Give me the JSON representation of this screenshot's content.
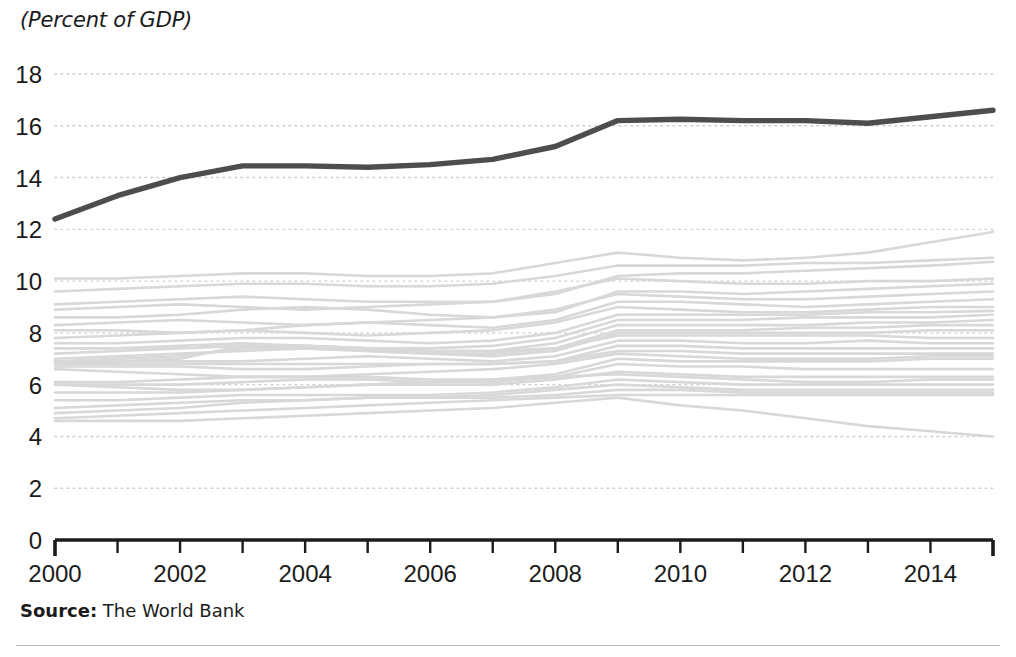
{
  "figure": {
    "unit_label": "(Percent of GDP)",
    "source_label": "Source:",
    "source_value": " The World Bank",
    "highlight_color": "#4d4d4d",
    "background_series_color": "#d8d8d8",
    "gridline_color": "#cccccc",
    "axis_color": "#1b1b1b",
    "background_color": "#ffffff"
  },
  "chart_data": {
    "type": "line",
    "title": "",
    "subtitle": "",
    "xlabel": "",
    "ylabel": "(Percent of GDP)",
    "xlim": [
      2000,
      2015
    ],
    "ylim": [
      0,
      18
    ],
    "grid": true,
    "legend": "none",
    "x": [
      2000,
      2001,
      2002,
      2003,
      2004,
      2005,
      2006,
      2007,
      2008,
      2009,
      2010,
      2011,
      2012,
      2013,
      2014,
      2015
    ],
    "x_tick_labels": [
      "2000",
      "2002",
      "2004",
      "2006",
      "2008",
      "2010",
      "2012",
      "2014"
    ],
    "x_tick_values": [
      2000,
      2002,
      2004,
      2006,
      2008,
      2010,
      2012,
      2014
    ],
    "x_minor_tick_values": [
      2000,
      2001,
      2002,
      2003,
      2004,
      2005,
      2006,
      2007,
      2008,
      2009,
      2010,
      2011,
      2012,
      2013,
      2014,
      2015
    ],
    "y_tick_labels": [
      "0",
      "2",
      "4",
      "6",
      "8",
      "10",
      "12",
      "14",
      "16",
      "18"
    ],
    "y_tick_values": [
      0,
      2,
      4,
      6,
      8,
      10,
      12,
      14,
      16,
      18
    ],
    "series": [
      {
        "name": "highlighted",
        "emphasis": "highlight",
        "color": "#4d4d4d",
        "values": [
          12.4,
          13.3,
          14.0,
          14.45,
          14.45,
          14.4,
          14.5,
          14.7,
          15.2,
          16.2,
          16.25,
          16.2,
          16.2,
          16.1,
          16.35,
          16.6
        ]
      },
      {
        "name": "background-01",
        "emphasis": "background",
        "color": "#d8d8d8",
        "values": [
          10.1,
          10.1,
          10.2,
          10.3,
          10.3,
          10.2,
          10.2,
          10.3,
          10.7,
          11.1,
          10.9,
          10.8,
          10.9,
          11.1,
          11.5,
          11.9
        ]
      },
      {
        "name": "background-02",
        "emphasis": "background",
        "color": "#d8d8d8",
        "values": [
          9.6,
          9.7,
          9.8,
          9.9,
          9.9,
          9.8,
          9.8,
          9.9,
          10.2,
          10.6,
          10.6,
          10.6,
          10.7,
          10.7,
          10.8,
          10.9
        ]
      },
      {
        "name": "background-03",
        "emphasis": "background",
        "color": "#d8d8d8",
        "values": [
          9.1,
          9.2,
          9.3,
          9.4,
          9.3,
          9.2,
          9.2,
          9.2,
          9.5,
          10.2,
          10.3,
          10.3,
          10.4,
          10.5,
          10.6,
          10.75
        ]
      },
      {
        "name": "background-04",
        "emphasis": "background",
        "color": "#d8d8d8",
        "values": [
          8.9,
          9.0,
          9.1,
          9.0,
          8.9,
          9.0,
          9.1,
          9.2,
          9.6,
          10.1,
          10.0,
          9.9,
          9.9,
          10.0,
          10.0,
          10.1
        ]
      },
      {
        "name": "background-05",
        "emphasis": "background",
        "color": "#d8d8d8",
        "values": [
          8.6,
          8.6,
          8.7,
          8.9,
          9.0,
          8.9,
          8.7,
          8.6,
          8.8,
          9.6,
          9.6,
          9.5,
          9.6,
          9.7,
          9.8,
          9.9
        ]
      },
      {
        "name": "background-06",
        "emphasis": "background",
        "color": "#d8d8d8",
        "values": [
          8.3,
          8.4,
          8.5,
          8.4,
          8.3,
          8.4,
          8.5,
          8.6,
          8.9,
          9.5,
          9.4,
          9.3,
          9.3,
          9.4,
          9.5,
          9.6
        ]
      },
      {
        "name": "background-07",
        "emphasis": "background",
        "color": "#d8d8d8",
        "values": [
          8.1,
          8.1,
          8.0,
          8.1,
          8.3,
          8.4,
          8.3,
          8.2,
          8.5,
          9.2,
          9.2,
          9.1,
          9.0,
          9.1,
          9.2,
          9.3
        ]
      },
      {
        "name": "background-08",
        "emphasis": "background",
        "color": "#d8d8d8",
        "values": [
          7.8,
          7.9,
          8.0,
          8.1,
          8.0,
          7.9,
          8.0,
          8.1,
          8.4,
          9.0,
          8.9,
          8.8,
          8.8,
          8.9,
          9.0,
          9.0
        ]
      },
      {
        "name": "background-09",
        "emphasis": "background",
        "color": "#d8d8d8",
        "values": [
          7.6,
          7.6,
          7.7,
          7.8,
          7.8,
          7.7,
          7.6,
          7.7,
          8.0,
          8.7,
          8.7,
          8.7,
          8.7,
          8.8,
          8.8,
          8.85
        ]
      },
      {
        "name": "background-10",
        "emphasis": "background",
        "color": "#d8d8d8",
        "values": [
          7.4,
          7.4,
          7.5,
          7.6,
          7.5,
          7.4,
          7.4,
          7.5,
          7.8,
          8.5,
          8.5,
          8.5,
          8.6,
          8.6,
          8.6,
          8.7
        ]
      },
      {
        "name": "background-11",
        "emphasis": "background",
        "color": "#d8d8d8",
        "values": [
          7.2,
          7.3,
          7.4,
          7.5,
          7.5,
          7.4,
          7.3,
          7.3,
          7.6,
          8.3,
          8.3,
          8.3,
          8.3,
          8.4,
          8.4,
          8.5
        ]
      },
      {
        "name": "background-12",
        "emphasis": "background",
        "color": "#d8d8d8",
        "values": [
          7.0,
          7.1,
          7.2,
          7.3,
          7.4,
          7.3,
          7.2,
          7.2,
          7.4,
          8.1,
          8.1,
          8.1,
          8.2,
          8.2,
          8.3,
          8.3
        ]
      },
      {
        "name": "background-13",
        "emphasis": "background",
        "color": "#d8d8d8",
        "values": [
          6.9,
          7.0,
          7.1,
          7.4,
          7.4,
          7.3,
          7.2,
          7.1,
          7.3,
          8.0,
          8.0,
          8.0,
          8.0,
          8.0,
          8.1,
          8.1
        ]
      },
      {
        "name": "background-14",
        "emphasis": "background",
        "color": "#d8d8d8",
        "values": [
          6.8,
          6.9,
          7.0,
          7.5,
          7.5,
          7.4,
          7.3,
          7.3,
          7.4,
          7.9,
          7.9,
          7.9,
          7.9,
          7.9,
          7.8,
          7.8
        ]
      },
      {
        "name": "background-15",
        "emphasis": "background",
        "color": "#d8d8d8",
        "values": [
          6.9,
          6.9,
          6.9,
          6.9,
          7.0,
          7.1,
          7.0,
          6.9,
          7.1,
          7.7,
          7.7,
          7.6,
          7.6,
          7.7,
          7.6,
          7.6
        ]
      },
      {
        "name": "background-16",
        "emphasis": "background",
        "color": "#d8d8d8",
        "values": [
          6.8,
          6.8,
          6.8,
          6.8,
          6.8,
          6.8,
          6.8,
          6.8,
          6.9,
          7.5,
          7.5,
          7.4,
          7.4,
          7.4,
          7.4,
          7.4
        ]
      },
      {
        "name": "background-17",
        "emphasis": "background",
        "color": "#d8d8d8",
        "values": [
          6.7,
          6.7,
          6.7,
          6.6,
          6.6,
          6.7,
          6.8,
          6.8,
          6.9,
          7.3,
          7.3,
          7.2,
          7.2,
          7.2,
          7.2,
          7.2
        ]
      },
      {
        "name": "background-18",
        "emphasis": "background",
        "color": "#d8d8d8",
        "values": [
          6.6,
          6.5,
          6.4,
          6.3,
          6.3,
          6.4,
          6.5,
          6.6,
          6.8,
          7.2,
          7.1,
          7.0,
          7.0,
          7.0,
          7.1,
          7.1
        ]
      },
      {
        "name": "background-19",
        "emphasis": "background",
        "color": "#d8d8d8",
        "values": [
          6.1,
          6.1,
          6.2,
          6.3,
          6.3,
          6.3,
          6.2,
          6.2,
          6.4,
          7.0,
          6.9,
          6.9,
          6.9,
          6.9,
          7.0,
          7.0
        ]
      },
      {
        "name": "background-20",
        "emphasis": "background",
        "color": "#d8d8d8",
        "values": [
          6.0,
          6.0,
          6.0,
          6.1,
          6.2,
          6.2,
          6.1,
          6.1,
          6.3,
          6.8,
          6.7,
          6.7,
          6.6,
          6.6,
          6.6,
          6.6
        ]
      },
      {
        "name": "background-21",
        "emphasis": "background",
        "color": "#d8d8d8",
        "values": [
          6.0,
          5.9,
          5.8,
          5.8,
          5.9,
          6.0,
          6.0,
          6.0,
          6.2,
          6.5,
          6.4,
          6.3,
          6.3,
          6.3,
          6.3,
          6.3
        ]
      },
      {
        "name": "background-22",
        "emphasis": "background",
        "color": "#d8d8d8",
        "values": [
          5.7,
          5.7,
          5.7,
          5.8,
          5.9,
          6.0,
          6.1,
          6.2,
          6.3,
          6.4,
          6.3,
          6.2,
          6.1,
          6.1,
          6.2,
          6.2
        ]
      },
      {
        "name": "background-23",
        "emphasis": "background",
        "color": "#d8d8d8",
        "values": [
          5.4,
          5.4,
          5.5,
          5.6,
          5.6,
          5.6,
          5.6,
          5.7,
          5.9,
          6.2,
          6.1,
          6.0,
          6.0,
          6.0,
          6.0,
          6.0
        ]
      },
      {
        "name": "background-24",
        "emphasis": "background",
        "color": "#d8d8d8",
        "values": [
          5.1,
          5.2,
          5.3,
          5.4,
          5.4,
          5.5,
          5.5,
          5.6,
          5.8,
          6.0,
          5.9,
          5.8,
          5.8,
          5.8,
          5.8,
          5.8
        ]
      },
      {
        "name": "background-25",
        "emphasis": "background",
        "color": "#d8d8d8",
        "values": [
          4.9,
          5.0,
          5.1,
          5.3,
          5.4,
          5.5,
          5.5,
          5.5,
          5.6,
          5.8,
          5.8,
          5.7,
          5.7,
          5.7,
          5.7,
          5.7
        ]
      },
      {
        "name": "background-26",
        "emphasis": "background",
        "color": "#d8d8d8",
        "values": [
          4.7,
          4.8,
          4.9,
          5.0,
          5.1,
          5.2,
          5.3,
          5.4,
          5.5,
          5.6,
          5.6,
          5.6,
          5.6,
          5.6,
          5.6,
          5.6
        ]
      },
      {
        "name": "background-27",
        "emphasis": "background",
        "color": "#d8d8d8",
        "values": [
          4.6,
          4.6,
          4.6,
          4.7,
          4.8,
          4.9,
          5.0,
          5.1,
          5.3,
          5.5,
          5.2,
          5.0,
          4.7,
          4.4,
          4.2,
          4.0
        ]
      }
    ]
  }
}
